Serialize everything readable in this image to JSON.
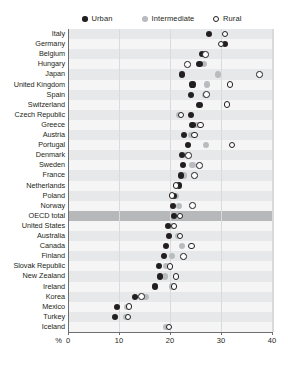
{
  "legend": {
    "items": [
      {
        "key": "urban",
        "label": "Urban",
        "marker": "filled-circle-icon",
        "color": "#231f20"
      },
      {
        "key": "intermediate",
        "label": "Intermediate",
        "marker": "gray-circle-icon",
        "color": "#b9bcbe"
      },
      {
        "key": "rural",
        "label": "Rural",
        "marker": "open-circle-icon",
        "color": "#ffffff"
      }
    ]
  },
  "axis": {
    "unit_label": "%",
    "ticks": [
      "0",
      "10",
      "20",
      "30",
      "40"
    ],
    "tick_values": [
      0,
      10,
      20,
      30,
      40
    ],
    "min": 0,
    "max": 40
  },
  "highlight_row": "OECD total",
  "chart_data": {
    "type": "scatter",
    "title": "",
    "xlabel": "%",
    "ylabel": "",
    "xlim": [
      0,
      40
    ],
    "grid": true,
    "legend_position": "top",
    "categories": [
      "Italy",
      "Germany",
      "Belgium",
      "Hungary",
      "Japan",
      "United Kingdom",
      "Spain",
      "Switzerland",
      "Czech Republic",
      "Greece",
      "Austria",
      "Portugal",
      "Denmark",
      "Sweden",
      "France",
      "Netherlands",
      "Poland",
      "Norway",
      "OECD total",
      "United States",
      "Australia",
      "Canada",
      "Finland",
      "Slovak Republic",
      "New Zealand",
      "Ireland",
      "Korea",
      "Mexico",
      "Turkey",
      "Iceland"
    ],
    "series": [
      {
        "name": "Urban",
        "color": "#231f20",
        "values": [
          27.4,
          30.6,
          26.0,
          25.6,
          22.2,
          24.2,
          24.0,
          25.6,
          24.0,
          24.2,
          22.6,
          23.4,
          22.2,
          22.4,
          22.0,
          21.6,
          20.6,
          20.4,
          20.6,
          19.4,
          19.6,
          19.0,
          18.6,
          17.6,
          17.8,
          16.8,
          13.0,
          9.4,
          9.0,
          null
        ]
      },
      {
        "name": "Intermediate",
        "color": "#b9bcbe",
        "values": [
          null,
          null,
          26.4,
          26.4,
          29.2,
          27.0,
          26.6,
          null,
          21.6,
          25.2,
          24.0,
          26.8,
          23.0,
          24.2,
          22.6,
          null,
          21.0,
          21.6,
          21.2,
          20.0,
          21.4,
          22.2,
          20.2,
          19.0,
          18.8,
          20.2,
          15.0,
          11.4,
          11.2,
          19.0
        ]
      },
      {
        "name": "Rural",
        "color": "#ffffff",
        "values": [
          30.6,
          29.8,
          26.8,
          23.2,
          37.3,
          31.6,
          27.0,
          31.0,
          22.0,
          25.8,
          24.6,
          32.0,
          23.4,
          25.6,
          24.6,
          21.0,
          20.2,
          24.2,
          21.8,
          20.6,
          21.8,
          24.0,
          22.4,
          19.8,
          21.0,
          20.6,
          14.2,
          11.8,
          11.6,
          19.6
        ]
      }
    ]
  }
}
